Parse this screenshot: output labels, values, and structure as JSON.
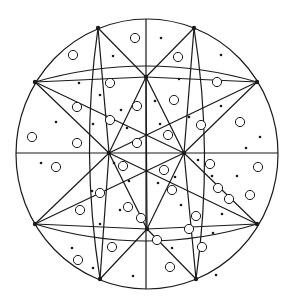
{
  "figure": {
    "title": "",
    "stroke_color": "#1a1a1a",
    "background": "#ffffff",
    "outer_circle": {
      "cx": 147,
      "cy": 154,
      "rx": 131,
      "ry": 135
    },
    "nodes": {
      "N": [
        146,
        77
      ],
      "W": [
        109,
        153
      ],
      "E": [
        184,
        153
      ],
      "S": [
        147,
        229
      ],
      "T": [
        146,
        19
      ],
      "B": [
        146,
        289
      ],
      "L": [
        16,
        153
      ],
      "R": [
        278,
        153
      ],
      "P1": [
        98,
        28
      ],
      "P2": [
        194,
        28
      ],
      "P3": [
        35,
        82
      ],
      "P4": [
        257,
        82
      ],
      "P5": [
        35,
        224
      ],
      "P6": [
        257,
        224
      ],
      "P7": [
        100,
        279
      ],
      "P8": [
        196,
        279
      ]
    },
    "lines": [
      [
        "T",
        "B"
      ],
      [
        "L",
        "R"
      ],
      [
        "P1",
        "W"
      ],
      [
        "P1",
        "N"
      ],
      [
        "P2",
        "N"
      ],
      [
        "P2",
        "E"
      ],
      [
        "P3",
        "N"
      ],
      [
        "P3",
        "E"
      ],
      [
        "P3",
        "W"
      ],
      [
        "P4",
        "N"
      ],
      [
        "P4",
        "W"
      ],
      [
        "P4",
        "E"
      ],
      [
        "P5",
        "W"
      ],
      [
        "P5",
        "S"
      ],
      [
        "P5",
        "E"
      ],
      [
        "P6",
        "E"
      ],
      [
        "P6",
        "S"
      ],
      [
        "P6",
        "W"
      ],
      [
        "P7",
        "W"
      ],
      [
        "P7",
        "S"
      ],
      [
        "P8",
        "S"
      ],
      [
        "P8",
        "E"
      ],
      [
        "N",
        "S"
      ],
      [
        "N",
        "W"
      ],
      [
        "N",
        "E"
      ],
      [
        "S",
        "W"
      ],
      [
        "S",
        "E"
      ]
    ],
    "arcs": [
      "M 35 82 Q 146 50 257 82",
      "M 35 224 Q 146 258 257 224",
      "M 98 28 Q 80 153 100 279",
      "M 194 28 Q 214 153 196 279"
    ],
    "open_circles": [
      [
        135,
        38
      ],
      [
        73,
        55
      ],
      [
        178,
        57
      ],
      [
        217,
        82
      ],
      [
        110,
        83
      ],
      [
        174,
        100
      ],
      [
        77,
        107
      ],
      [
        137,
        106
      ],
      [
        201,
        125
      ],
      [
        240,
        122
      ],
      [
        110,
        120
      ],
      [
        168,
        135
      ],
      [
        32,
        137
      ],
      [
        77,
        143
      ],
      [
        137,
        143
      ],
      [
        258,
        167
      ],
      [
        56,
        167
      ],
      [
        123,
        166
      ],
      [
        164,
        170
      ],
      [
        210,
        164
      ],
      [
        218,
        188
      ],
      [
        100,
        193
      ],
      [
        128,
        207
      ],
      [
        172,
        190
      ],
      [
        229,
        199
      ],
      [
        80,
        210
      ],
      [
        141,
        218
      ],
      [
        196,
        216
      ],
      [
        250,
        195
      ],
      [
        157,
        240
      ],
      [
        78,
        260
      ],
      [
        112,
        247
      ],
      [
        202,
        247
      ],
      [
        170,
        267
      ],
      [
        189,
        229
      ]
    ],
    "dots": [
      [
        161,
        38
      ],
      [
        113,
        56
      ],
      [
        221,
        55
      ],
      [
        79,
        83
      ],
      [
        179,
        79
      ],
      [
        100,
        95
      ],
      [
        155,
        101
      ],
      [
        121,
        110
      ],
      [
        56,
        122
      ],
      [
        93,
        124
      ],
      [
        160,
        124
      ],
      [
        127,
        128
      ],
      [
        189,
        117
      ],
      [
        221,
        106
      ],
      [
        260,
        137
      ],
      [
        246,
        148
      ],
      [
        41,
        163
      ],
      [
        114,
        163
      ],
      [
        198,
        160
      ],
      [
        212,
        176
      ],
      [
        129,
        181
      ],
      [
        175,
        177
      ],
      [
        92,
        191
      ],
      [
        100,
        224
      ],
      [
        158,
        183
      ],
      [
        237,
        176
      ],
      [
        181,
        205
      ],
      [
        222,
        214
      ],
      [
        120,
        210
      ],
      [
        72,
        248
      ],
      [
        213,
        233
      ],
      [
        172,
        248
      ],
      [
        133,
        276
      ],
      [
        93,
        268
      ],
      [
        216,
        275
      ]
    ]
  }
}
